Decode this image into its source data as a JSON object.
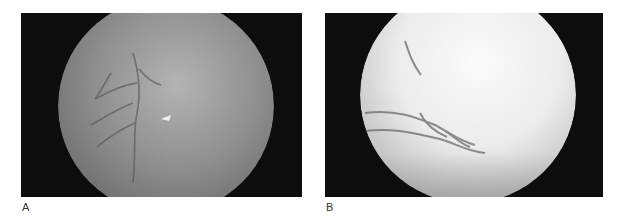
{
  "figure": {
    "panels": [
      {
        "label": "A",
        "description": "Fundus photograph with dimly illuminated circular field showing retinal vessels and a small bright reflex"
      },
      {
        "label": "B",
        "description": "Brightly illuminated circular fundus field with dark retinal vessels in lower half"
      }
    ]
  }
}
